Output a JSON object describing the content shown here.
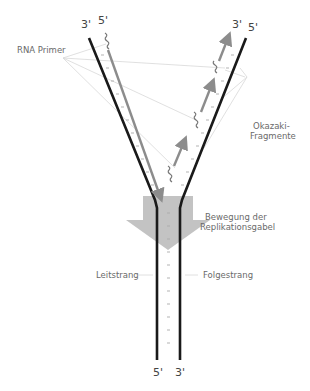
{
  "diagram": {
    "labels": {
      "rna_primer": "RNA Primer",
      "okazaki_line1": "Okazaki-",
      "okazaki_line2": "Fragmente",
      "fork_movement_line1": "Bewegung der",
      "fork_movement_line2": "Replikationsgabel",
      "leading_strand": "Leitstrang",
      "lagging_strand": "Folgestrang"
    },
    "strand_ends": {
      "top_left_outer": "3'",
      "top_left_inner": "5'",
      "top_right_inner": "3'",
      "top_right_outer": "5'",
      "bottom_left": "5'",
      "bottom_right": "3'"
    },
    "colors": {
      "parent_strand": "#1a1a1a",
      "new_strand": "#8c8c8c",
      "fork_arrow": "#b5b5b5",
      "leader_lines": "#d6d6d6",
      "text": "#6a6a6a"
    }
  }
}
